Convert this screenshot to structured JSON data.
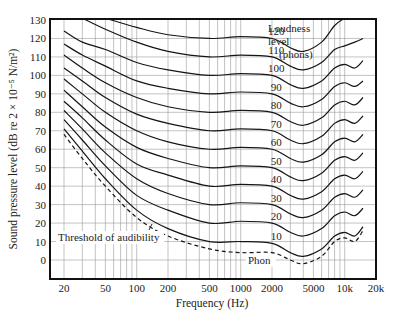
{
  "chart_data": {
    "type": "line",
    "title": "",
    "xlabel": "Frequency (Hz)",
    "ylabel": "Sound pressure level (dB re 2 × 10⁻⁵ N/m²)",
    "xscale": "log",
    "xlim": [
      20,
      20000
    ],
    "ylim": [
      -8,
      130
    ],
    "grid": true,
    "x_ticks": [
      20,
      50,
      100,
      200,
      500,
      1000,
      2000,
      5000,
      10000,
      20000
    ],
    "x_tick_labels": [
      "20",
      "50",
      "100",
      "200",
      "500",
      "1000",
      "2000",
      "5000",
      "10k",
      "20k"
    ],
    "y_ticks": [
      0,
      10,
      20,
      30,
      40,
      50,
      60,
      70,
      80,
      90,
      100,
      110,
      120,
      130
    ],
    "y_tick_labels": [
      "0",
      "10",
      "20",
      "30",
      "40",
      "50",
      "60",
      "70",
      "80",
      "90",
      "100",
      "110",
      "120",
      "130"
    ],
    "legend_title": [
      "Loudness",
      "level",
      "(phons)"
    ],
    "x": [
      20,
      30,
      50,
      100,
      200,
      500,
      1000,
      2000,
      3000,
      4000,
      6000,
      8000,
      10000,
      12500,
      15000
    ],
    "series": [
      {
        "name": "120",
        "label": "120",
        "values": [
          null,
          null,
          131,
          126,
          122,
          120,
          121,
          120,
          115,
          113,
          118,
          127,
          131,
          null,
          null
        ],
        "start_x": 40
      },
      {
        "name": "110",
        "label": "110",
        "values": [
          null,
          131,
          125,
          118,
          113,
          110,
          111,
          110,
          105,
          103,
          107,
          114,
          116,
          118,
          120
        ],
        "start_x": 30
      },
      {
        "name": "100",
        "label": "100",
        "values": [
          124,
          118,
          114,
          107,
          103,
          100,
          101,
          100,
          95,
          93,
          97,
          104,
          106,
          104,
          108
        ]
      },
      {
        "name": "90",
        "label": "90",
        "values": [
          117,
          111,
          105,
          97,
          93,
          90,
          91,
          90,
          85,
          83,
          87,
          94,
          96,
          94,
          97
        ]
      },
      {
        "name": "80",
        "label": "80",
        "values": [
          111,
          104,
          96,
          88,
          83,
          80,
          81,
          80,
          75,
          73,
          77,
          84,
          86,
          84,
          88
        ]
      },
      {
        "name": "70",
        "label": "70",
        "values": [
          104,
          97,
          88,
          79,
          74,
          70,
          71,
          70,
          65,
          63,
          67,
          74,
          76,
          74,
          78
        ]
      },
      {
        "name": "60",
        "label": "60",
        "values": [
          98,
          90,
          80,
          70,
          64,
          60,
          61,
          60,
          55,
          53,
          57,
          64,
          66,
          64,
          68
        ]
      },
      {
        "name": "50",
        "label": "50",
        "values": [
          92,
          83,
          72,
          61,
          55,
          50,
          51,
          50,
          45,
          43,
          47,
          54,
          56,
          54,
          58
        ]
      },
      {
        "name": "40",
        "label": "40",
        "values": [
          86,
          77,
          65,
          52,
          46,
          40,
          41,
          40,
          35,
          33,
          37,
          44,
          46,
          44,
          48
        ]
      },
      {
        "name": "30",
        "label": "30",
        "values": [
          81,
          71,
          58,
          44,
          36,
          30,
          31,
          30,
          25,
          23,
          27,
          34,
          36,
          34,
          38
        ]
      },
      {
        "name": "20",
        "label": "20",
        "values": [
          76,
          65,
          51,
          35,
          27,
          20,
          21,
          20,
          15,
          13,
          17,
          24,
          26,
          24,
          28
        ]
      },
      {
        "name": "10",
        "label": "10",
        "values": [
          71,
          59,
          44,
          27,
          17,
          10,
          10,
          9,
          4,
          2,
          6,
          13,
          15,
          13,
          18
        ]
      },
      {
        "name": "Threshold of audibility",
        "label": "Phon",
        "style": "dashed",
        "values": [
          68,
          55,
          40,
          23,
          13,
          6,
          4,
          4,
          0,
          -2,
          2,
          10,
          12,
          10,
          16
        ]
      }
    ],
    "annotations": [
      {
        "text": "Threshold of audibility",
        "points_to": "dashed curve near 130 Hz"
      },
      {
        "text": "Phon",
        "near": "dashed curve at ~2500 Hz"
      }
    ]
  },
  "labels": {
    "xlabel": "Frequency (Hz)",
    "ylabel": "Sound pressure level (dB re 2 × 10⁻⁵ N/m²)",
    "legend_line1": "Loudness",
    "legend_line2": "level",
    "legend_line3": "(phons)",
    "threshold": "Threshold of audibility",
    "phon": "Phon"
  }
}
